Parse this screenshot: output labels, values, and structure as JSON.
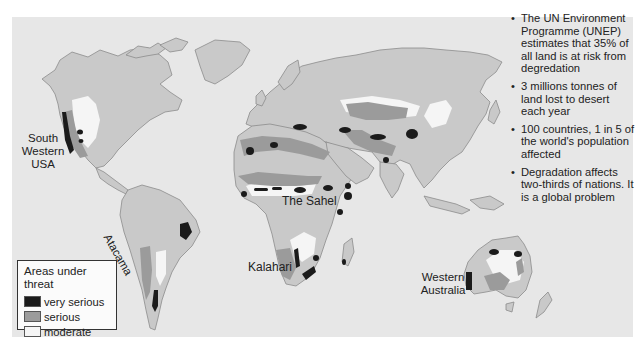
{
  "map": {
    "title": "World areas under threat of desertification",
    "colors": {
      "background": "#e7e7e7",
      "land": "#c9c9c9",
      "coast": "#8c8c8c",
      "very_serious": "#1b1b1b",
      "serious": "#9b9b9b",
      "moderate": "#f5f5f5"
    },
    "labels": {
      "sw_usa": [
        "South",
        "Western",
        "USA"
      ],
      "atacama": "Atacama",
      "sahel": "The Sahel",
      "kalahari": "Kalahari",
      "w_australia": [
        "Western",
        "Australia"
      ]
    }
  },
  "legend": {
    "title": "Areas under threat",
    "items": [
      {
        "label": "very serious",
        "color": "#1b1b1b"
      },
      {
        "label": "serious",
        "color": "#9b9b9b"
      },
      {
        "label": "moderate",
        "color": "#f5f5f5"
      }
    ]
  },
  "facts": [
    "The UN Environment Programme (UNEP) estimates that 35% of all land is at risk from degredation",
    "3 millions tonnes of land lost to desert each year",
    "100 countries, 1 in 5 of the world's population affected",
    "Degradation affects two-thirds of nations. It is a global problem"
  ]
}
